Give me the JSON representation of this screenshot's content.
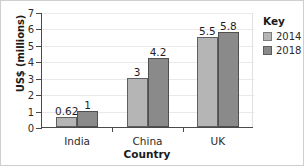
{
  "chart_data": {
    "type": "bar",
    "title": "",
    "xlabel": "Country",
    "ylabel": "US$ (millions)",
    "categories": [
      "India",
      "China",
      "UK"
    ],
    "series": [
      {
        "name": "2014",
        "color": "#b5b5b5",
        "values": [
          0.62,
          3,
          5.5
        ],
        "labels": [
          "0.62",
          "3",
          "5.5"
        ]
      },
      {
        "name": "2018",
        "color": "#8a8a8a",
        "values": [
          1,
          4.2,
          5.8
        ],
        "labels": [
          "1",
          "4.2",
          "5.8"
        ]
      }
    ],
    "ylim": [
      0,
      7
    ],
    "yticks": [
      0,
      1,
      2,
      3,
      4,
      5,
      6,
      7
    ],
    "ytick_labels": [
      "0",
      "1",
      "2",
      "3",
      "4",
      "5",
      "6",
      "7"
    ],
    "grid": true,
    "legend": {
      "title": "Key",
      "position": "right",
      "entries": [
        {
          "label": "2014",
          "color": "#b5b5b5"
        },
        {
          "label": "2018",
          "color": "#8a8a8a"
        }
      ]
    }
  }
}
